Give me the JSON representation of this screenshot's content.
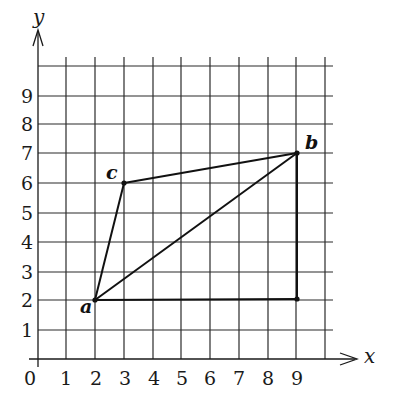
{
  "diagram": {
    "axes": {
      "x_label": "x",
      "y_label": "y",
      "origin_label": "0",
      "x_ticks": [
        "1",
        "2",
        "3",
        "4",
        "5",
        "6",
        "7",
        "8",
        "9"
      ],
      "y_ticks": [
        "1",
        "2",
        "3",
        "4",
        "5",
        "6",
        "7",
        "8",
        "9"
      ]
    },
    "points": [
      {
        "name": "a",
        "x": 2,
        "y": 2
      },
      {
        "name": "b",
        "x": 9,
        "y": 7
      },
      {
        "name": "c",
        "x": 3,
        "y": 6
      }
    ],
    "corner": {
      "x": 9,
      "y": 2
    },
    "segments": [
      {
        "from": "a",
        "to": "c"
      },
      {
        "from": "c",
        "to": "b"
      },
      {
        "from": "a",
        "to": "b"
      },
      {
        "from": "a",
        "to": "corner"
      },
      {
        "from": "corner",
        "to": "b"
      }
    ],
    "labels": {
      "a": "a",
      "b": "b",
      "c": "c"
    }
  }
}
